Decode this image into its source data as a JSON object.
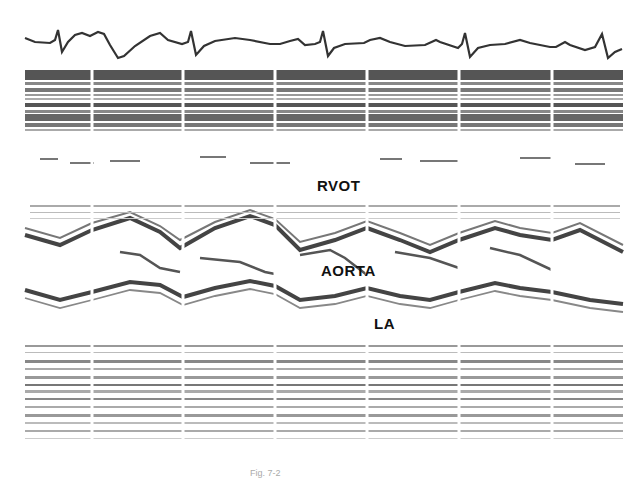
{
  "figure": {
    "type": "M-mode echocardiogram",
    "labels": {
      "rvot": "RVOT",
      "aorta": "AORTA",
      "la": "LA"
    },
    "caption": "Fig. 7-2",
    "traces": [
      "ECG",
      "aortic root M-mode"
    ],
    "timing_mark_x": [
      92,
      183,
      275,
      367,
      459,
      552
    ],
    "colors": {
      "background": "#ffffff",
      "trace": "#333333",
      "band": "#555555",
      "speckle": "#666666"
    }
  }
}
